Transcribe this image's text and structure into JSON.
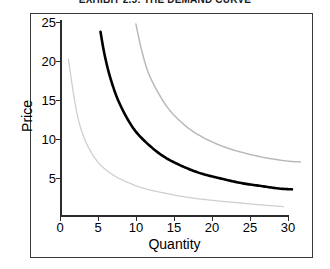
{
  "figure": {
    "title": "EXHIBIT 2.5: THE DEMAND CURVE",
    "title_clipped": true
  },
  "axis_titles": {
    "x": "Quantity",
    "y": "Price"
  },
  "colors": {
    "main_curve": "#000000",
    "upper_curve": "#b9b9b9",
    "lower_curve": "#cfcfcf",
    "axis": "#2b2b2b",
    "frame": "#3a3a3a",
    "background": "#ffffff"
  },
  "chart_data": {
    "type": "line",
    "title": "EXHIBIT 2.5: THE DEMAND CURVE",
    "xlabel": "Quantity",
    "ylabel": "Price",
    "xlim": [
      0,
      30
    ],
    "ylim": [
      0,
      25
    ],
    "xticks": [
      0,
      5,
      10,
      15,
      20,
      25,
      30
    ],
    "yticks": [
      0,
      5,
      10,
      15,
      20,
      25
    ],
    "grid": false,
    "legend": "none",
    "series": [
      {
        "name": "demand-curve-lower",
        "style": "light-gray",
        "x": [
          1.0,
          1.6,
          2.2,
          3.0,
          4.0,
          5.0,
          6.5,
          8.0,
          10.0,
          12.5,
          15.0,
          18.0,
          21.0,
          24.0,
          26.5
        ],
        "y": [
          20.0,
          15.6,
          12.2,
          9.6,
          7.6,
          6.3,
          5.1,
          4.3,
          3.5,
          2.9,
          2.4,
          2.0,
          1.7,
          1.4,
          1.2
        ]
      },
      {
        "name": "demand-curve-main",
        "style": "black-bold",
        "x": [
          4.8,
          5.3,
          6.0,
          7.0,
          8.5,
          10.0,
          12.0,
          14.0,
          16.5,
          19.0,
          21.5,
          24.0,
          26.0,
          27.5
        ],
        "y": [
          23.5,
          20.5,
          17.5,
          14.5,
          11.5,
          9.6,
          7.8,
          6.6,
          5.5,
          4.8,
          4.2,
          3.8,
          3.5,
          3.4
        ]
      },
      {
        "name": "demand-curve-upper",
        "style": "gray",
        "x": [
          9.0,
          9.6,
          10.4,
          11.5,
          13.0,
          15.0,
          17.0,
          19.5,
          22.0,
          24.5,
          27.0,
          28.5
        ],
        "y": [
          24.5,
          21.5,
          18.5,
          16.0,
          13.5,
          11.4,
          10.0,
          8.8,
          8.0,
          7.4,
          7.0,
          6.9
        ]
      }
    ]
  }
}
